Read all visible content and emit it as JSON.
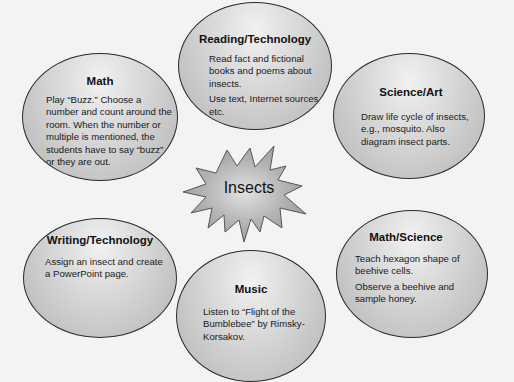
{
  "diagram": {
    "type": "thematic web",
    "center": {
      "label": "Insects"
    },
    "nodes": [
      {
        "id": "reading-technology",
        "title": "Reading/Technology",
        "lines": [
          "Read fact and fictional books and poems about insects.",
          "Use text, Internet sources, etc."
        ]
      },
      {
        "id": "math",
        "title": "Math",
        "lines": [
          "Play “Buzz.” Choose a number and count around the room. When the number or multiple is mentioned, the students have to say “buzz” or they are out."
        ]
      },
      {
        "id": "science-art",
        "title": "Science/Art",
        "lines": [
          "Draw life cycle of insects, e.g., mosquito. Also diagram insect parts."
        ]
      },
      {
        "id": "writing-technology",
        "title": "Writing/Technology",
        "lines": [
          "Assign an insect and create a PowerPoint page."
        ]
      },
      {
        "id": "math-science",
        "title": "Math/Science",
        "lines": [
          "Teach hexagon shape of beehive cells.",
          "Observe a beehive and sample honey."
        ]
      },
      {
        "id": "music",
        "title": "Music",
        "lines": [
          "Listen to “Flight of the Bumblebee” by Rimsky-Korsakov."
        ]
      }
    ],
    "colors": {
      "background": "#f3f3f3",
      "ellipse_fill_light": "#f1f1f1",
      "ellipse_fill_dark": "#b5b5b5",
      "outline": "#2a2a2a",
      "starburst_fill": "#a8a8a8"
    }
  }
}
